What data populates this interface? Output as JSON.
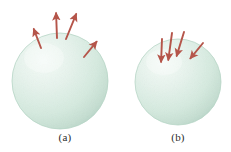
{
  "figure": {
    "background_color": "#ffffff",
    "sphere_fill_light": "#f2faf6",
    "sphere_fill_mid": "#ddeee4",
    "sphere_fill_edge": "#c3ded0",
    "sphere_rim_color": "#b4d4c4",
    "arrow_color": "#b5554a",
    "arrow_color_dark": "#8c4a3e",
    "caption_color": "#2b2b2b"
  },
  "panels": [
    {
      "id": "a",
      "label": "(a)",
      "sphere": {
        "name": "sphere-outward",
        "cx": 60,
        "cy": 81,
        "r": 48
      },
      "arrow_direction": "outward",
      "arrows": [
        {
          "name": "arrow-outward-1",
          "x1": 41,
          "y1": 48,
          "x2": 33,
          "y2": 27
        },
        {
          "name": "arrow-outward-2",
          "x1": 57,
          "y1": 38,
          "x2": 56,
          "y2": 11
        },
        {
          "name": "arrow-outward-3",
          "x1": 66,
          "y1": 39,
          "x2": 77,
          "y2": 12
        },
        {
          "name": "arrow-outward-4",
          "x1": 84,
          "y1": 57,
          "x2": 98,
          "y2": 40
        }
      ]
    },
    {
      "id": "b",
      "label": "(b)",
      "sphere": {
        "name": "sphere-inward",
        "cx": 178,
        "cy": 82,
        "r": 43
      },
      "arrow_direction": "inward",
      "arrows": [
        {
          "name": "arrow-inward-1",
          "x1": 172,
          "y1": 33,
          "x2": 168,
          "y2": 62
        },
        {
          "name": "arrow-inward-2",
          "x1": 184,
          "y1": 32,
          "x2": 176,
          "y2": 58
        },
        {
          "name": "arrow-inward-3",
          "x1": 162,
          "y1": 39,
          "x2": 161,
          "y2": 64
        },
        {
          "name": "arrow-inward-4",
          "x1": 203,
          "y1": 43,
          "x2": 189,
          "y2": 60
        }
      ]
    }
  ]
}
